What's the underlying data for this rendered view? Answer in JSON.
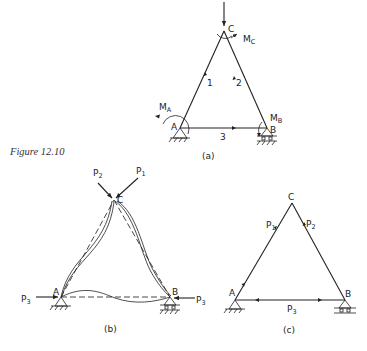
{
  "figure": {
    "caption": "Figure 12.10",
    "panels": [
      {
        "id": "a",
        "label": "(a)",
        "nodes": {
          "A": "A",
          "B": "B",
          "C": "C"
        },
        "members": [
          "1",
          "2",
          "3"
        ],
        "moments": {
          "MA": "M",
          "MA_sub": "A",
          "MB": "M",
          "MB_sub": "B",
          "MC": "M",
          "MC_sub": "C"
        }
      },
      {
        "id": "b",
        "label": "(b)",
        "nodes": {
          "A": "A",
          "B": "B",
          "C": "C"
        },
        "loads": {
          "P1": "P",
          "P1_sub": "1",
          "P2": "P",
          "P2_sub": "2",
          "P3": "P",
          "P3_sub": "3"
        }
      },
      {
        "id": "c",
        "label": "(c)",
        "nodes": {
          "A": "A",
          "B": "B",
          "C": "C"
        },
        "loads": {
          "P1": "P",
          "P1_sub": "1",
          "P2": "P",
          "P2_sub": "2",
          "P3": "P",
          "P3_sub": "3"
        }
      }
    ]
  },
  "colors": {
    "ink": "#222222",
    "background": "#ffffff"
  }
}
